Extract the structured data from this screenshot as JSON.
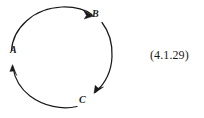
{
  "figure": {
    "kind": "cycle-diagram",
    "background_color": "#ffffff",
    "stroke_color": "#1a1a1a",
    "nodes": [
      {
        "id": "a",
        "label": "A",
        "angle_deg": 188,
        "arrow_direction": "up"
      },
      {
        "id": "b",
        "label": "B",
        "angle_deg": 305,
        "arrow_direction": "clockwise-right"
      },
      {
        "id": "c",
        "label": "C",
        "angle_deg": 68,
        "arrow_direction": "down-left"
      }
    ],
    "arcs": [
      {
        "id": "arc-a-to-b",
        "from": "A",
        "to": "B",
        "sweep": "clockwise",
        "arrowhead_at": "B"
      },
      {
        "id": "arc-b-to-c",
        "from": "B",
        "to": "C",
        "sweep": "clockwise",
        "arrowhead_at": "C"
      },
      {
        "id": "arc-c-to-a",
        "from": "C",
        "to": "A",
        "sweep": "clockwise",
        "arrowhead_at": "A"
      }
    ],
    "circle": {
      "center_x": 62,
      "center_y": 58,
      "radius": 51
    }
  },
  "equation": {
    "number": "(4.1.29)"
  }
}
